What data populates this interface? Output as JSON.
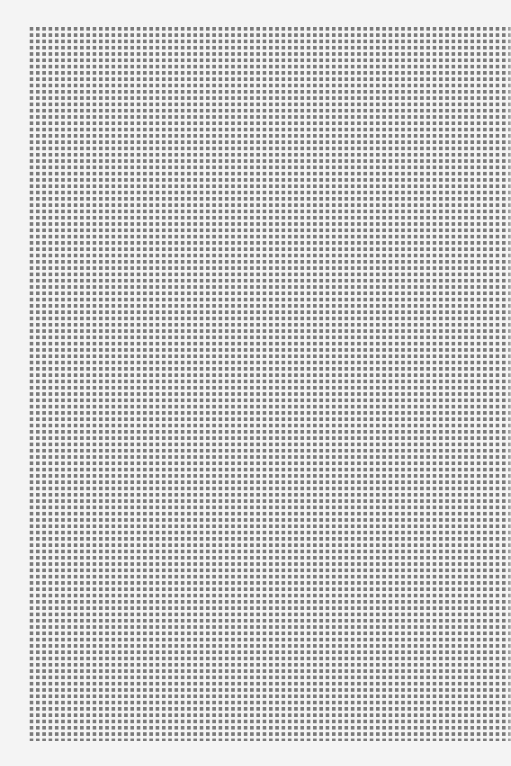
{
  "page": {
    "background": "#f4f4f4",
    "pattern": {
      "type": "square-grid",
      "cell_color": "#7a7a7a",
      "gap_color": "#f4f4f4",
      "columns": 76,
      "rows": 113,
      "pitch_px": 6.3,
      "cell_px": 4
    }
  }
}
